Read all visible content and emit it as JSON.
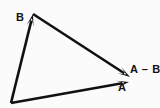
{
  "figure": {
    "background_color": "#fbfbfb",
    "stroke_color": "#111111",
    "labels": {
      "vector_a": "A",
      "vector_b": "B",
      "vector_a_minus_b": "A – B"
    }
  },
  "chart_data": {
    "type": "diagram",
    "subtype": "vector-diagram",
    "coordinate_space": {
      "width": 160,
      "height": 108,
      "origin_note": "pixel coordinates, y increases downward"
    },
    "grid": false,
    "legend": null,
    "xlabel": "",
    "ylabel": "",
    "points": [
      {
        "name": "O",
        "x": 11,
        "y": 103,
        "role": "common-tail"
      },
      {
        "name": "B_tip",
        "x": 33,
        "y": 14,
        "role": "head-of-B"
      },
      {
        "name": "A_tip",
        "x": 129,
        "y": 82,
        "role": "head-of-A"
      },
      {
        "name": "AminusB_tip",
        "x": 130,
        "y": 77,
        "role": "head-of-A-minus-B"
      }
    ],
    "vectors": [
      {
        "name": "A",
        "label": "A",
        "from": [
          11,
          103
        ],
        "to": [
          129,
          82
        ],
        "arrowhead": true,
        "label_position": [
          121,
          88
        ]
      },
      {
        "name": "B",
        "label": "B",
        "from": [
          11,
          103
        ],
        "to": [
          33,
          14
        ],
        "arrowhead": true,
        "label_position": [
          19,
          18
        ]
      },
      {
        "name": "A-B",
        "label": "A – B",
        "from": [
          33,
          14
        ],
        "to": [
          130,
          77
        ],
        "arrowhead": true,
        "label_position": [
          133,
          70
        ]
      }
    ],
    "annotations": [
      {
        "text": "A",
        "x": 121,
        "y": 88
      },
      {
        "text": "B",
        "x": 19,
        "y": 18
      },
      {
        "text": "A – B",
        "x": 133,
        "y": 70
      }
    ],
    "stroke_width": 2.6,
    "stroke_color": "#111111",
    "background": "#fbfbfb"
  }
}
